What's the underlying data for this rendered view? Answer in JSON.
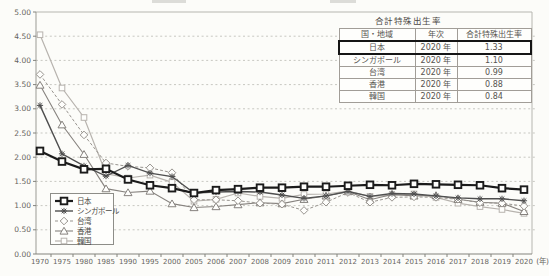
{
  "overlay_table": {
    "title": "合計特殊出生率",
    "headers": [
      "国・地域",
      "年次",
      "合計特殊出生率"
    ],
    "rows": [
      [
        "日本",
        "2020 年",
        "1.33"
      ],
      [
        "シンガポール",
        "2020 年",
        "1.10"
      ],
      [
        "台湾",
        "2020 年",
        "0.99"
      ],
      [
        "香港",
        "2020 年",
        "0.88"
      ],
      [
        "韓国",
        "2020 年",
        "0.84"
      ]
    ],
    "highlighted_row": 0
  },
  "chart_data": {
    "type": "line",
    "x_unit_label": "(年)",
    "ylim": [
      0,
      5
    ],
    "ytick_step": 0.5,
    "grid": "horizontal-dashed",
    "legend_position": "inside-bottom-left",
    "categories": [
      "1970",
      "1975",
      "1980",
      "1985",
      "1990",
      "1995",
      "2000",
      "2005",
      "2006",
      "2007",
      "2008",
      "2009",
      "2010",
      "2011",
      "2012",
      "2013",
      "2014",
      "2015",
      "2016",
      "2017",
      "2018",
      "2019",
      "2020"
    ],
    "series": [
      {
        "id": "japan",
        "name": "日本",
        "marker": "square-bold",
        "color": "#1b1b1b",
        "line_width": 2.2,
        "dash": "",
        "values": [
          2.13,
          1.91,
          1.75,
          1.76,
          1.54,
          1.42,
          1.36,
          1.26,
          1.32,
          1.34,
          1.37,
          1.37,
          1.39,
          1.39,
          1.41,
          1.43,
          1.42,
          1.45,
          1.44,
          1.43,
          1.42,
          1.36,
          1.33
        ]
      },
      {
        "id": "singapore",
        "name": "シンガポール",
        "marker": "asterisk",
        "color": "#4f4f4f",
        "line_width": 1.4,
        "dash": "",
        "values": [
          3.07,
          2.07,
          1.82,
          1.61,
          1.83,
          1.67,
          1.6,
          1.26,
          1.28,
          1.29,
          1.28,
          1.22,
          1.15,
          1.2,
          1.29,
          1.19,
          1.25,
          1.24,
          1.2,
          1.16,
          1.14,
          1.14,
          1.1
        ]
      },
      {
        "id": "taiwan",
        "name": "台湾",
        "marker": "diamond",
        "color": "#98948f",
        "line_width": 1,
        "dash": "3,2",
        "values": [
          3.71,
          3.09,
          2.46,
          1.88,
          1.81,
          1.78,
          1.68,
          1.12,
          1.12,
          1.1,
          1.05,
          1.03,
          0.9,
          1.07,
          1.27,
          1.07,
          1.17,
          1.18,
          1.17,
          1.13,
          1.06,
          1.05,
          0.99
        ]
      },
      {
        "id": "hongkong",
        "name": "香港",
        "marker": "triangle",
        "color": "#86827e",
        "line_width": 1.1,
        "dash": "",
        "values": [
          3.49,
          2.67,
          2.06,
          1.35,
          1.27,
          1.3,
          1.04,
          0.96,
          0.98,
          1.02,
          1.06,
          1.04,
          1.13,
          1.2,
          1.29,
          1.12,
          1.23,
          1.2,
          1.21,
          1.13,
          1.07,
          1.05,
          0.88
        ]
      },
      {
        "id": "korea",
        "name": "韓国",
        "marker": "square",
        "color": "#b7b3ae",
        "line_width": 1.2,
        "dash": "",
        "values": [
          4.53,
          3.43,
          2.82,
          1.66,
          1.57,
          1.63,
          1.48,
          1.09,
          1.13,
          1.26,
          1.19,
          1.15,
          1.23,
          1.24,
          1.3,
          1.19,
          1.21,
          1.24,
          1.17,
          1.05,
          0.98,
          0.92,
          0.84
        ]
      }
    ]
  }
}
